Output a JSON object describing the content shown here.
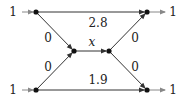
{
  "diagram": {
    "type": "flow-network",
    "colors": {
      "edge": "#333333",
      "node": "#111111",
      "in_out_arrow": "#888888",
      "text": "#222222"
    },
    "nodes": [
      {
        "id": "s1",
        "x": 36,
        "y": 12
      },
      {
        "id": "s2",
        "x": 36,
        "y": 90
      },
      {
        "id": "a",
        "x": 74,
        "y": 51
      },
      {
        "id": "b",
        "x": 109,
        "y": 51
      },
      {
        "id": "t1",
        "x": 147,
        "y": 12
      },
      {
        "id": "t2",
        "x": 147,
        "y": 90
      }
    ],
    "inputs": [
      {
        "label": "1",
        "to": "s1"
      },
      {
        "label": "1",
        "to": "s2"
      }
    ],
    "outputs": [
      {
        "label": "1",
        "from": "t1"
      },
      {
        "label": "1",
        "from": "t2"
      }
    ],
    "edges": [
      {
        "from": "s1",
        "to": "t1",
        "label": "2.8"
      },
      {
        "from": "s2",
        "to": "t2",
        "label": "1.9"
      },
      {
        "from": "s1",
        "to": "a",
        "label": "0"
      },
      {
        "from": "s2",
        "to": "a",
        "label": "0"
      },
      {
        "from": "a",
        "to": "b",
        "label": "x"
      },
      {
        "from": "b",
        "to": "t1",
        "label": "0"
      },
      {
        "from": "b",
        "to": "t2",
        "label": "0"
      }
    ]
  }
}
